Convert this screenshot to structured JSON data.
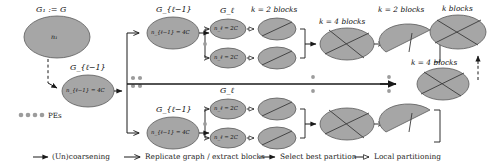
{
  "figure": {
    "type": "multilevel-graph-partitioning-pipeline",
    "background": "#ffffff",
    "node_fill": "#a6a6a6",
    "node_stroke": "#555555",
    "line_color": "#1a1a1a"
  },
  "graph_labels": {
    "g1": "G₁ := G",
    "g_l_minus_1_left": "G_{ℓ−1}",
    "g_l_minus_1_top": "G_{ℓ−1}",
    "g_l_minus_1_bottom": "G_{ℓ−1}",
    "g_l_top": "G_ℓ",
    "g_l_bottom": "G_ℓ"
  },
  "node_sizes": {
    "n1": "n₁",
    "n_l_minus_1_left": "n_{ℓ−1} = 4C",
    "n_l_minus_1_top": "n_{ℓ−1} = 4C",
    "n_l_minus_1_bottom": "n_{ℓ−1} = 4C",
    "n_l_top": "n_ℓ = 2C",
    "n_l_bottom": "n_ℓ = 2C"
  },
  "block_headers": {
    "k2_top": "k = 2 blocks",
    "k4_mid": "k = 4 blocks",
    "k2_right": "k = 2 blocks",
    "k_blocks": "k blocks",
    "k4_final": "k = 4 blocks"
  },
  "pes": {
    "label": "PEs",
    "dot_count": 4
  },
  "legend": [
    {
      "id": "uncoarsening",
      "label": "(Un)coarsening",
      "arrow": "solid-filled"
    },
    {
      "id": "replicate-extract",
      "label": "Replicate graph / extract blocks",
      "arrow": "solid-open"
    },
    {
      "id": "select-best",
      "label": "Select best partition",
      "arrow": "solid-filled"
    },
    {
      "id": "local-partitioning",
      "label": "Local partitioning",
      "arrow": "solid-hollow"
    }
  ]
}
